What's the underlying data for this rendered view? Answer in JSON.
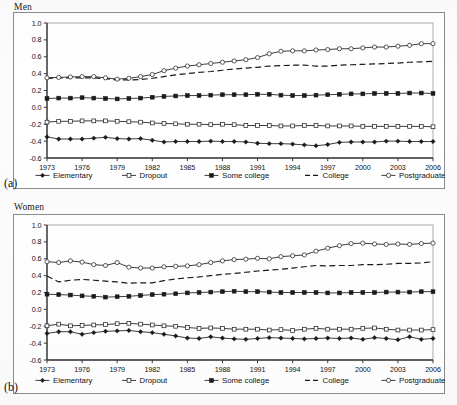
{
  "figure": {
    "panels": [
      {
        "key": "men",
        "title": "Men",
        "subfig": "(a)",
        "chart_data": {
          "type": "line",
          "title": "Men",
          "xlabel": "",
          "ylabel": "",
          "xlim": [
            1973,
            2006
          ],
          "ylim": [
            -0.6,
            1.0
          ],
          "ytick_labels": [
            "1.0",
            "0.8",
            "0.6",
            "0.4",
            "0.2",
            "0.0",
            "-0.2",
            "-0.4",
            "-0.6"
          ],
          "ytick_values": [
            1.0,
            0.8,
            0.6,
            0.4,
            0.2,
            0.0,
            -0.2,
            -0.4,
            -0.6
          ],
          "xtick_labels": [
            "1973",
            "1976",
            "1979",
            "1982",
            "1985",
            "1988",
            "1991",
            "1994",
            "1997",
            "2000",
            "2003",
            "2006"
          ],
          "xtick_values": [
            1973,
            1976,
            1979,
            1982,
            1985,
            1988,
            1991,
            1994,
            1997,
            2000,
            2003,
            2006
          ],
          "x": [
            1973,
            1974,
            1975,
            1976,
            1977,
            1978,
            1979,
            1980,
            1981,
            1982,
            1983,
            1984,
            1985,
            1986,
            1987,
            1988,
            1989,
            1990,
            1991,
            1992,
            1993,
            1994,
            1995,
            1996,
            1997,
            1998,
            1999,
            2000,
            2001,
            2002,
            2003,
            2004,
            2005,
            2006
          ],
          "grid": false,
          "legend_position": "bottom",
          "series": [
            {
              "name": "Elementary",
              "marker": "filled-diamond",
              "dash": "solid",
              "values": [
                -0.35,
                -0.375,
                -0.375,
                -0.375,
                -0.365,
                -0.355,
                -0.37,
                -0.375,
                -0.37,
                -0.39,
                -0.41,
                -0.405,
                -0.405,
                -0.405,
                -0.4,
                -0.405,
                -0.405,
                -0.41,
                -0.425,
                -0.43,
                -0.43,
                -0.435,
                -0.445,
                -0.455,
                -0.44,
                -0.415,
                -0.41,
                -0.41,
                -0.41,
                -0.4,
                -0.4,
                -0.405,
                -0.405,
                -0.405
              ]
            },
            {
              "name": "Dropout",
              "marker": "open-square",
              "dash": "solid",
              "values": [
                -0.175,
                -0.165,
                -0.165,
                -0.16,
                -0.16,
                -0.16,
                -0.165,
                -0.17,
                -0.175,
                -0.185,
                -0.19,
                -0.195,
                -0.2,
                -0.2,
                -0.205,
                -0.2,
                -0.205,
                -0.215,
                -0.215,
                -0.215,
                -0.22,
                -0.22,
                -0.215,
                -0.215,
                -0.22,
                -0.22,
                -0.22,
                -0.225,
                -0.225,
                -0.225,
                -0.225,
                -0.225,
                -0.225,
                -0.23
              ]
            },
            {
              "name": "Some college",
              "marker": "filled-square",
              "dash": "solid",
              "values": [
                0.105,
                0.11,
                0.11,
                0.115,
                0.11,
                0.105,
                0.1,
                0.105,
                0.11,
                0.12,
                0.13,
                0.135,
                0.14,
                0.14,
                0.145,
                0.15,
                0.15,
                0.15,
                0.155,
                0.155,
                0.145,
                0.14,
                0.14,
                0.145,
                0.15,
                0.155,
                0.16,
                0.16,
                0.165,
                0.165,
                0.165,
                0.17,
                0.17,
                0.165
              ]
            },
            {
              "name": "College",
              "marker": "none",
              "dash": "dashed",
              "values": [
                0.345,
                0.35,
                0.35,
                0.35,
                0.35,
                0.34,
                0.325,
                0.325,
                0.33,
                0.345,
                0.365,
                0.385,
                0.4,
                0.415,
                0.425,
                0.44,
                0.455,
                0.465,
                0.475,
                0.49,
                0.495,
                0.5,
                0.5,
                0.49,
                0.49,
                0.5,
                0.505,
                0.51,
                0.515,
                0.52,
                0.525,
                0.535,
                0.54,
                0.545
              ]
            },
            {
              "name": "Postgraduate",
              "marker": "open-circle",
              "dash": "solid",
              "values": [
                0.35,
                0.355,
                0.36,
                0.365,
                0.365,
                0.35,
                0.335,
                0.345,
                0.365,
                0.39,
                0.435,
                0.465,
                0.49,
                0.505,
                0.52,
                0.535,
                0.55,
                0.565,
                0.59,
                0.635,
                0.665,
                0.67,
                0.67,
                0.68,
                0.685,
                0.695,
                0.695,
                0.705,
                0.715,
                0.715,
                0.725,
                0.735,
                0.755,
                0.755
              ]
            }
          ]
        }
      },
      {
        "key": "women",
        "title": "Women",
        "subfig": "(b)",
        "chart_data": {
          "type": "line",
          "title": "Women",
          "xlabel": "",
          "ylabel": "",
          "xlim": [
            1973,
            2006
          ],
          "ylim": [
            -0.6,
            1.0
          ],
          "ytick_labels": [
            "1.0",
            "0.8",
            "0.6",
            "0.4",
            "0.2",
            "0.0",
            "-0.2",
            "-0.4",
            "-0.6"
          ],
          "ytick_values": [
            1.0,
            0.8,
            0.6,
            0.4,
            0.2,
            0.0,
            -0.2,
            -0.4,
            -0.6
          ],
          "xtick_labels": [
            "1973",
            "1976",
            "1979",
            "1982",
            "1985",
            "1988",
            "1991",
            "1994",
            "1997",
            "2000",
            "2003",
            "2006"
          ],
          "xtick_values": [
            1973,
            1976,
            1979,
            1982,
            1985,
            1988,
            1991,
            1994,
            1997,
            2000,
            2003,
            2006
          ],
          "x": [
            1973,
            1974,
            1975,
            1976,
            1977,
            1978,
            1979,
            1980,
            1981,
            1982,
            1983,
            1984,
            1985,
            1986,
            1987,
            1988,
            1989,
            1990,
            1991,
            1992,
            1993,
            1994,
            1995,
            1996,
            1997,
            1998,
            1999,
            2000,
            2001,
            2002,
            2003,
            2004,
            2005,
            2006
          ],
          "grid": false,
          "legend_position": "bottom",
          "series": [
            {
              "name": "Elementary",
              "marker": "filled-diamond",
              "dash": "solid",
              "values": [
                -0.285,
                -0.265,
                -0.265,
                -0.295,
                -0.275,
                -0.26,
                -0.255,
                -0.25,
                -0.265,
                -0.275,
                -0.295,
                -0.315,
                -0.34,
                -0.345,
                -0.325,
                -0.34,
                -0.35,
                -0.355,
                -0.345,
                -0.335,
                -0.34,
                -0.345,
                -0.35,
                -0.345,
                -0.34,
                -0.345,
                -0.34,
                -0.355,
                -0.335,
                -0.345,
                -0.36,
                -0.325,
                -0.355,
                -0.345
              ]
            },
            {
              "name": "Dropout",
              "marker": "open-square",
              "dash": "solid",
              "values": [
                -0.195,
                -0.175,
                -0.195,
                -0.19,
                -0.185,
                -0.18,
                -0.17,
                -0.165,
                -0.175,
                -0.185,
                -0.195,
                -0.2,
                -0.215,
                -0.225,
                -0.22,
                -0.225,
                -0.235,
                -0.235,
                -0.235,
                -0.245,
                -0.24,
                -0.25,
                -0.235,
                -0.225,
                -0.235,
                -0.235,
                -0.235,
                -0.225,
                -0.22,
                -0.235,
                -0.245,
                -0.245,
                -0.245,
                -0.24
              ]
            },
            {
              "name": "Some college",
              "marker": "filled-square",
              "dash": "solid",
              "values": [
                0.18,
                0.175,
                0.17,
                0.16,
                0.155,
                0.145,
                0.15,
                0.155,
                0.165,
                0.175,
                0.18,
                0.185,
                0.195,
                0.2,
                0.205,
                0.21,
                0.215,
                0.21,
                0.21,
                0.205,
                0.2,
                0.2,
                0.2,
                0.2,
                0.195,
                0.195,
                0.2,
                0.2,
                0.2,
                0.205,
                0.205,
                0.205,
                0.21,
                0.21
              ]
            },
            {
              "name": "College",
              "marker": "none",
              "dash": "dashed",
              "values": [
                0.395,
                0.325,
                0.345,
                0.355,
                0.345,
                0.335,
                0.325,
                0.31,
                0.315,
                0.315,
                0.34,
                0.36,
                0.375,
                0.385,
                0.4,
                0.415,
                0.425,
                0.44,
                0.455,
                0.465,
                0.475,
                0.49,
                0.505,
                0.52,
                0.515,
                0.52,
                0.52,
                0.53,
                0.53,
                0.535,
                0.545,
                0.545,
                0.55,
                0.565
              ]
            },
            {
              "name": "Postgraduate",
              "marker": "open-circle",
              "dash": "solid",
              "values": [
                0.565,
                0.555,
                0.575,
                0.56,
                0.53,
                0.52,
                0.555,
                0.5,
                0.49,
                0.49,
                0.505,
                0.51,
                0.515,
                0.53,
                0.555,
                0.575,
                0.59,
                0.595,
                0.605,
                0.6,
                0.625,
                0.635,
                0.645,
                0.69,
                0.725,
                0.755,
                0.78,
                0.785,
                0.775,
                0.77,
                0.775,
                0.77,
                0.78,
                0.785,
                0.79
              ]
            }
          ]
        }
      }
    ],
    "legend": {
      "items": [
        {
          "label": "Elementary",
          "marker": "filled-diamond",
          "dash": "solid"
        },
        {
          "label": "Dropout",
          "marker": "open-square",
          "dash": "solid"
        },
        {
          "label": "Some college",
          "marker": "filled-square",
          "dash": "solid"
        },
        {
          "label": "College",
          "marker": "none",
          "dash": "dashed"
        },
        {
          "label": "Postgraduate",
          "marker": "open-circle",
          "dash": "solid"
        }
      ]
    },
    "colors": {
      "line": "#1a1a1a",
      "axis": "#3a3a3a",
      "frame": "#8c8c8c",
      "background": "#ffffff"
    }
  }
}
